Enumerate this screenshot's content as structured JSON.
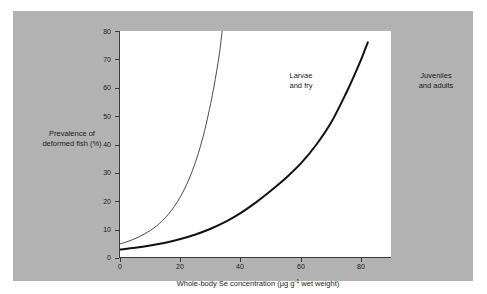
{
  "figure": {
    "panel_color": "#b2b2b2",
    "plot_background": "#ffffff",
    "axis_color": "#3a3a3a"
  },
  "axis_titles": {
    "y": "Prevalence of deformed fish (%)",
    "y_line1": "Prevalence of",
    "y_line2": "deformed fish (%)",
    "x_prefix": "Whole-body Se concentration (µg g",
    "x_exponent": "-1",
    "x_suffix": " wet weight)"
  },
  "annotations": {
    "larvae_line1": "Larvae",
    "larvae_line2": "and fry",
    "juveniles_line1": "Juveniles",
    "juveniles_line2": "and adults"
  },
  "ticks": {
    "y": [
      "0",
      "10",
      "20",
      "30",
      "40",
      "50",
      "60",
      "70",
      "80"
    ],
    "x": [
      "0",
      "20",
      "40",
      "60",
      "80"
    ]
  },
  "chart_data": {
    "type": "line",
    "title": "",
    "xlabel": "Whole-body Se concentration (µg g-1 wet weight)",
    "ylabel": "Prevalence of deformed fish (%)",
    "xlim": [
      0,
      90
    ],
    "ylim": [
      0,
      80
    ],
    "xticks": [
      0,
      20,
      40,
      60,
      80
    ],
    "yticks": [
      0,
      10,
      20,
      30,
      40,
      50,
      60,
      70,
      80
    ],
    "grid": false,
    "legend": "inline-annotations",
    "series": [
      {
        "name": "Larvae and fry",
        "style": "thin",
        "color": "#4a4a4a",
        "linewidth": 1,
        "annotation": "Larvae and fry",
        "x": [
          0,
          2,
          4,
          6,
          8,
          10,
          12,
          14,
          16,
          18,
          20,
          22,
          24,
          26,
          28,
          30,
          31,
          32,
          33,
          33.8
        ],
        "y": [
          5.0,
          5.6,
          6.4,
          7.3,
          8.4,
          9.7,
          11.2,
          13.1,
          15.4,
          18.2,
          21.6,
          25.8,
          30.9,
          37.2,
          44.9,
          54.4,
          59.9,
          66.0,
          72.8,
          80.0
        ]
      },
      {
        "name": "Juveniles and adults",
        "style": "thick",
        "color": "#111111",
        "linewidth": 2,
        "annotation": "Juveniles and adults",
        "x": [
          0,
          5,
          10,
          15,
          20,
          25,
          30,
          35,
          40,
          45,
          50,
          55,
          60,
          65,
          70,
          75,
          78,
          80,
          82
        ],
        "y": [
          3.0,
          3.6,
          4.4,
          5.4,
          6.7,
          8.3,
          10.3,
          12.8,
          15.9,
          19.6,
          23.8,
          28.3,
          33.5,
          40.0,
          48.0,
          58.5,
          65.5,
          70.5,
          76.0
        ]
      }
    ]
  }
}
